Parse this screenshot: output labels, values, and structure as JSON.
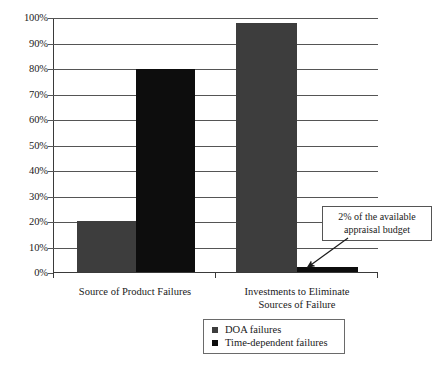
{
  "chart_data": {
    "type": "bar",
    "title": "",
    "xlabel": "",
    "ylabel": "",
    "ylim": [
      0,
      100
    ],
    "grid": true,
    "legend_position": "bottom",
    "categories": [
      "Source of Product Failures",
      "Investments to Eliminate Sources of Failure"
    ],
    "series": [
      {
        "name": "DOA failures",
        "color": "#3d3d3d",
        "values": [
          20,
          98
        ]
      },
      {
        "name": "Time-dependent failures",
        "color": "#0d0d0d",
        "values": [
          80,
          2
        ]
      }
    ],
    "y_ticks": [
      "0%",
      "10%",
      "20%",
      "30%",
      "40%",
      "50%",
      "60%",
      "70%",
      "80%",
      "90%",
      "100%"
    ],
    "y_tick_values": [
      0,
      10,
      20,
      30,
      40,
      50,
      60,
      70,
      80,
      90,
      100
    ],
    "annotations": [
      {
        "text_line1": "2% of the available",
        "text_line2": "appraisal budget",
        "points_to": "Time-dependent failures bar in second category (2%)"
      }
    ]
  },
  "axis": {
    "tick_0": "0%",
    "tick_1": "10%",
    "tick_2": "20%",
    "tick_3": "30%",
    "tick_4": "40%",
    "tick_5": "50%",
    "tick_6": "60%",
    "tick_7": "70%",
    "tick_8": "80%",
    "tick_9": "90%",
    "tick_10": "100%"
  },
  "categories": {
    "cat_0_line1": "Source of Product Failures",
    "cat_0_line2": "",
    "cat_1_line1": "Investments to Eliminate",
    "cat_1_line2": "Sources of Failure"
  },
  "legend": {
    "item_0_label": "DOA failures",
    "item_0_color": "#3d3d3d",
    "item_1_label": "Time-dependent failures",
    "item_1_color": "#0d0d0d"
  },
  "callout": {
    "line1": "2% of the available",
    "line2": "appraisal budget"
  }
}
